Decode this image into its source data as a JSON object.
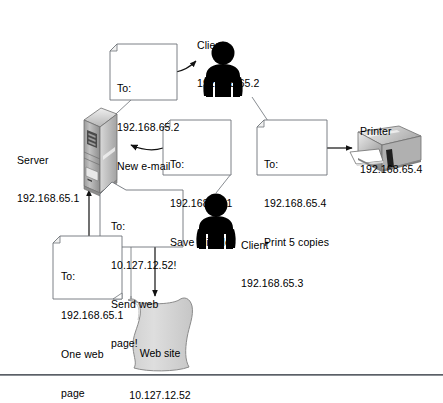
{
  "figure": {
    "background": "#ffffff",
    "nodes": [
      {
        "id": "client1",
        "icon": "person-icon",
        "label_line1": "Client",
        "label_line2": "192.168.65.2"
      },
      {
        "id": "printer",
        "icon": "printer-icon",
        "label_line1": "Printer",
        "label_line2": "192.168.65.4"
      },
      {
        "id": "server",
        "icon": "server-tower-icon",
        "label_line1": "Server",
        "label_line2": "192.168.65.1"
      },
      {
        "id": "client2",
        "icon": "person-icon",
        "label_line1": "Client",
        "label_line2": "192.168.65.3"
      },
      {
        "id": "website",
        "icon": "web-page-scroll-icon",
        "label_line1": "Web site",
        "label_line2": "10.127.12.52"
      }
    ],
    "notes": [
      {
        "id": "email-note",
        "shape": "dogear-note",
        "line1": "To:",
        "line2": "192.168.65.2",
        "line3": "New e-mail"
      },
      {
        "id": "savefile-note",
        "shape": "dogear-note",
        "line1": "To:",
        "line2": "192.168.65.1",
        "line3": "Save this file"
      },
      {
        "id": "print-note",
        "shape": "dogear-note",
        "line1": "To:",
        "line2": "192.168.65.4",
        "line3": "Print 5 copies"
      },
      {
        "id": "sendweb-note",
        "shape": "callout-note",
        "line1": "To:",
        "line2": "10.127.12.52!",
        "line3": "Send web",
        "line4": "page!"
      },
      {
        "id": "oneweb-note",
        "shape": "dogear-note",
        "line1": "To:",
        "line2": "192.168.65.1",
        "line3": "One web",
        "line4": "page"
      }
    ],
    "colors": {
      "line": "#1a1a1a",
      "note_fill": "#ffffff",
      "note_stroke": "#6e7378",
      "person_fill": "#000000",
      "device_light": "#e4e4e4",
      "device_mid": "#b8b8b8",
      "device_dark": "#8a8a8a",
      "scroll_fill": "#d6d6d6",
      "scroll_stroke": "#8a8a8a",
      "rule": "#5a5f66"
    },
    "footer_rule_visible": true
  }
}
